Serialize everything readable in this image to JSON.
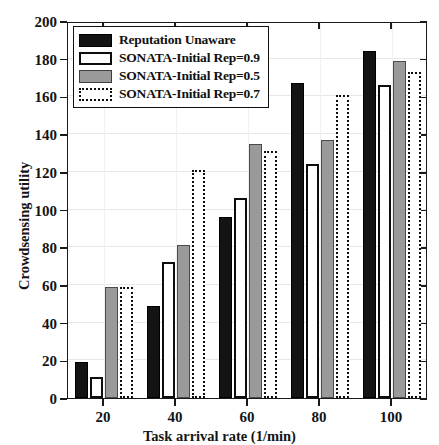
{
  "chart_data": {
    "type": "bar",
    "title": "",
    "xlabel": "Task arrival rate (1/min)",
    "ylabel": "Crowdsensing utility",
    "categories": [
      "20",
      "40",
      "60",
      "80",
      "100"
    ],
    "series": [
      {
        "name": "Reputation Unaware",
        "color": "#131313",
        "style": "solid-black",
        "values": [
          19,
          49,
          96,
          167,
          184
        ]
      },
      {
        "name": "SONATA-Initial Rep=0.9",
        "color": "#ffffff",
        "style": "solid-white",
        "values": [
          11,
          72,
          106,
          124,
          166
        ]
      },
      {
        "name": "SONATA-Initial Rep=0.5",
        "color": "#9a9a9a",
        "style": "solid-gray",
        "values": [
          59,
          81,
          135,
          137,
          179
        ]
      },
      {
        "name": "SONATA-Initial Rep=0.7",
        "color": "#ffffff",
        "style": "dotted-white",
        "values": [
          59,
          121,
          131,
          161,
          173
        ]
      }
    ],
    "ylim": [
      0,
      200
    ],
    "ytick_values": [
      0,
      20,
      40,
      60,
      80,
      100,
      120,
      140,
      160,
      180,
      200
    ],
    "ytick_labels": [
      "0",
      "20",
      "40",
      "60",
      "80",
      "100",
      "120",
      "140",
      "160",
      "180",
      "200"
    ],
    "xtick_labels": [
      "20",
      "40",
      "60",
      "80",
      "100"
    ],
    "grid": true,
    "legend_position": "upper left"
  }
}
